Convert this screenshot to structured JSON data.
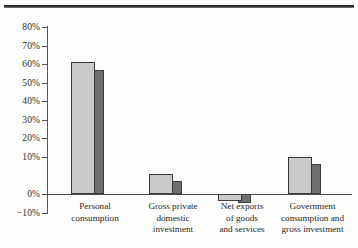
{
  "figure": {
    "top_rule": true,
    "background": "#fdfdfc"
  },
  "chart_data": {
    "type": "bar",
    "title": "",
    "subtitle": "",
    "xlabel": "",
    "ylabel": "",
    "categories": [
      "Personal consumption",
      "Gross private domestic investment",
      "Net exports of goods and services",
      "Government consumption and gross investment"
    ],
    "category_lines": [
      [
        "Personal",
        "consumption"
      ],
      [
        "Gross private",
        "domestic",
        "investment"
      ],
      [
        "Net exports",
        "of goods",
        "and services"
      ],
      [
        "Government",
        "consumption and",
        "gross investment"
      ]
    ],
    "series": [
      {
        "name": "Series 1",
        "color": "#cacaca",
        "values": [
          71,
          11,
          -4,
          20
        ]
      },
      {
        "name": "Series 2",
        "color": "#6f6f6f",
        "values": [
          67,
          7,
          -5,
          16
        ]
      }
    ],
    "ylim": [
      -10,
      80
    ],
    "ytick_values": [
      80,
      70,
      60,
      50,
      40,
      30,
      20,
      10,
      0,
      -10
    ],
    "ytick_labels": [
      "80%",
      "70%",
      "60%",
      "50%",
      "40%",
      "30%",
      "20%",
      "10%",
      "0%",
      "−10%"
    ],
    "grid": false,
    "legend": "none",
    "zero_line": true,
    "axis_color": "#555555"
  }
}
